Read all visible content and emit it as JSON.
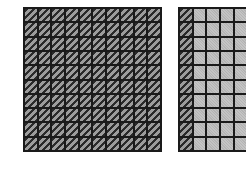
{
  "figure": {
    "grids": [
      {
        "id": "grid-a",
        "rows": 10,
        "cols": 10,
        "shaded_columns": 10,
        "shaded_cells": 100
      },
      {
        "id": "grid-b",
        "rows": 10,
        "cols": 10,
        "shaded_columns": 1,
        "shaded_cells": 10,
        "note": "partially cropped at right edge"
      }
    ],
    "colors": {
      "grid_line": "#1a1a1a",
      "hatch_dark": "#2a2a2a",
      "hatch_light": "#9c9c9c",
      "unshaded": "#bdbdbd",
      "background": "#ffffff"
    }
  }
}
